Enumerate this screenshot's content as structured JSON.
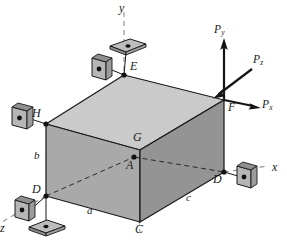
{
  "figure": {
    "background_color": "#ffffff"
  },
  "colors": {
    "line": "#1a1a1a",
    "top_face": "#c9c9c9",
    "left_face": "#a8a8a8",
    "right_face": "#949494",
    "support_plate": "#b3b3b3",
    "support_plate_dark": "#8f8f8f",
    "axis_dash": "#808080"
  },
  "axes": [
    {
      "id": "y-axis",
      "label": "y",
      "label_x": 119,
      "label_y": 2
    },
    {
      "id": "x-axis",
      "label": "x",
      "label_x": 272,
      "label_y": 167
    },
    {
      "id": "z-axis",
      "label": "z",
      "label_x": 0,
      "label_y": 226
    }
  ],
  "vertices": [
    {
      "id": "E",
      "label": "E",
      "x": 124,
      "y": 75,
      "label_x": 130,
      "label_y": 64,
      "dot": true
    },
    {
      "id": "F",
      "label": "F",
      "x": 224,
      "y": 100,
      "label_x": 228,
      "label_y": 103,
      "dot": false
    },
    {
      "id": "H",
      "label": "H",
      "x": 46,
      "y": 124,
      "label_x": 33,
      "label_y": 110,
      "dot": true
    },
    {
      "id": "G",
      "label": "G",
      "x": 140,
      "y": 150,
      "label_x": 133,
      "label_y": 135,
      "dot": false
    },
    {
      "id": "A",
      "label": "A",
      "x": 134,
      "y": 157,
      "label_x": 128,
      "label_y": 160,
      "dot": true
    },
    {
      "id": "D-left",
      "label": "D",
      "x": 46,
      "y": 196,
      "label_x": 33,
      "label_y": 186,
      "dot": true
    },
    {
      "id": "C",
      "label": "C",
      "x": 140,
      "y": 222,
      "label_x": 135,
      "label_y": 225,
      "dot": false
    },
    {
      "id": "D-right",
      "label": "D",
      "x": 224,
      "y": 172,
      "label_x": 214,
      "label_y": 176,
      "dot": true
    }
  ],
  "dimensions": [
    {
      "id": "a",
      "label": "a",
      "label_x": 87,
      "label_y": 208
    },
    {
      "id": "b",
      "label": "b",
      "label_x": 34,
      "label_y": 154
    },
    {
      "id": "c",
      "label": "c",
      "label_x": 186,
      "label_y": 196
    }
  ],
  "forces": [
    {
      "id": "Py",
      "base": "P",
      "sub": "y",
      "label_x": 215,
      "label_y": 28
    },
    {
      "id": "Pz",
      "base": "P",
      "sub": "z",
      "label_x": 254,
      "label_y": 58
    },
    {
      "id": "Px",
      "base": "P",
      "sub": "x",
      "label_x": 263,
      "label_y": 103
    }
  ],
  "supports": [
    {
      "id": "support-E-vertical",
      "type": "vertical-plate",
      "x": 100,
      "y": 64
    },
    {
      "id": "support-E-horizontal",
      "type": "horizontal-plate",
      "x": 128,
      "y": 46
    },
    {
      "id": "support-H-vertical",
      "type": "vertical-plate",
      "x": 20,
      "y": 112
    },
    {
      "id": "support-Dleft-vertical",
      "type": "vertical-plate",
      "x": 23,
      "y": 207
    },
    {
      "id": "support-Dleft-horizontal",
      "type": "horizontal-plate",
      "x": 45,
      "y": 226
    },
    {
      "id": "support-Dright-vertical",
      "type": "vertical-plate",
      "x": 244,
      "y": 172
    }
  ]
}
